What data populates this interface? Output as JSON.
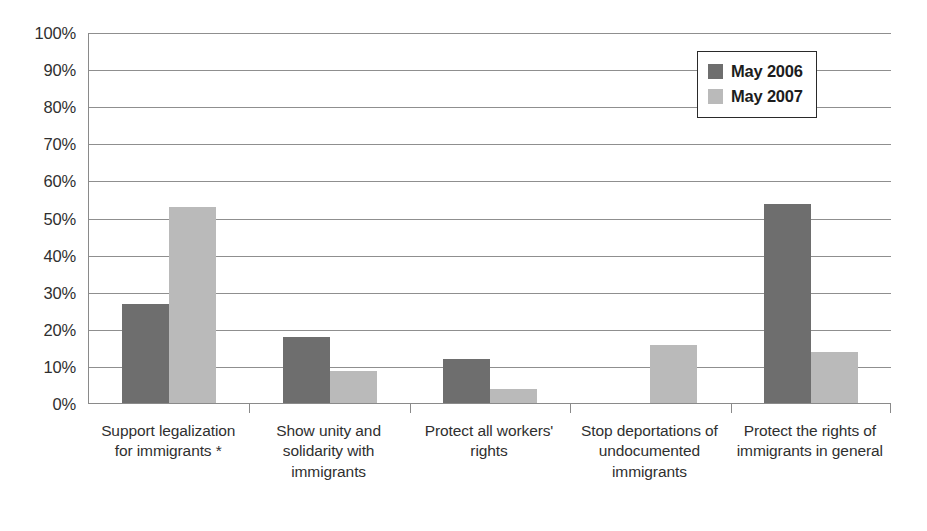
{
  "chart_data": {
    "type": "bar",
    "title": "",
    "subtitle": "",
    "xlabel": "",
    "ylabel": "",
    "ylim": [
      0,
      100
    ],
    "y_tick_labels": [
      "100%",
      "90%",
      "80%",
      "70%",
      "60%",
      "50%",
      "40%",
      "30%",
      "20%",
      "10%",
      "0%"
    ],
    "y_tick_values": [
      100,
      90,
      80,
      70,
      60,
      50,
      40,
      30,
      20,
      10,
      0
    ],
    "grid": true,
    "legend_position": "top-right",
    "categories": [
      "Support legalization for immigrants *",
      "Show unity and solidarity with immigrants",
      "Protect all workers' rights",
      "Stop deportations of undocumented immigrants",
      "Protect the rights of immigrants in general"
    ],
    "series": [
      {
        "name": "May 2006",
        "color": "#6e6e6e",
        "values": [
          27,
          18,
          12,
          0,
          54
        ]
      },
      {
        "name": "May 2007",
        "color": "#bababa",
        "values": [
          53,
          9,
          4,
          16,
          14
        ]
      }
    ],
    "value_suffix": "%",
    "annotations": [
      "*"
    ]
  },
  "legend": {
    "items": [
      {
        "label": "May 2006",
        "color": "#6e6e6e"
      },
      {
        "label": "May 2007",
        "color": "#bababa"
      }
    ]
  },
  "colors": {
    "series_2006": "#6e6e6e",
    "series_2007": "#bababa",
    "gridline": "#8f8f8f",
    "axis": "#8a8a8a",
    "text": "#2f2f2f",
    "background": "#ffffff"
  }
}
